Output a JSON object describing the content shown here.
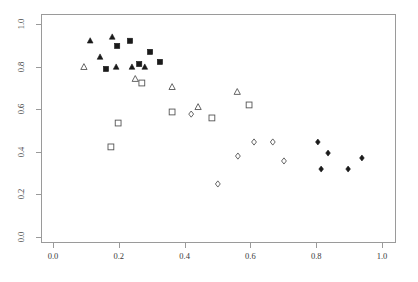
{
  "chart_data": {
    "type": "scatter",
    "title": "",
    "xlabel": "",
    "ylabel": "",
    "xlim": [
      0.0,
      1.0
    ],
    "ylim": [
      0.0,
      1.0
    ],
    "grid": false,
    "legend": "none",
    "xticks": [
      "0.0",
      "0.2",
      "0.4",
      "0.6",
      "0.8",
      "1.0"
    ],
    "xtick_values": [
      0.0,
      0.2,
      0.4,
      0.6,
      0.8,
      1.0
    ],
    "yticks": [
      "0.0",
      "0.2",
      "0.4",
      "0.6",
      "0.8",
      "1.0"
    ],
    "ytick_values": [
      0.0,
      0.2,
      0.4,
      0.6,
      0.8,
      1.0
    ],
    "frame": true,
    "series": [
      {
        "name": "filled-triangle",
        "marker": "triangle-filled",
        "color": "#1a1a1a",
        "points": [
          {
            "x": 0.113,
            "y": 0.921
          },
          {
            "x": 0.18,
            "y": 0.939
          },
          {
            "x": 0.143,
            "y": 0.845
          },
          {
            "x": 0.192,
            "y": 0.798
          },
          {
            "x": 0.24,
            "y": 0.798
          },
          {
            "x": 0.279,
            "y": 0.798
          }
        ]
      },
      {
        "name": "filled-square",
        "marker": "square-filled",
        "color": "#1a1a1a",
        "points": [
          {
            "x": 0.195,
            "y": 0.897
          },
          {
            "x": 0.234,
            "y": 0.921
          },
          {
            "x": 0.295,
            "y": 0.869
          },
          {
            "x": 0.262,
            "y": 0.812
          },
          {
            "x": 0.161,
            "y": 0.789
          },
          {
            "x": 0.325,
            "y": 0.822
          }
        ]
      },
      {
        "name": "open-triangle",
        "marker": "triangle-open",
        "color": "#555555",
        "points": [
          {
            "x": 0.094,
            "y": 0.798
          },
          {
            "x": 0.25,
            "y": 0.742
          },
          {
            "x": 0.362,
            "y": 0.704
          },
          {
            "x": 0.441,
            "y": 0.61
          },
          {
            "x": 0.56,
            "y": 0.681
          }
        ]
      },
      {
        "name": "open-square",
        "marker": "square-open",
        "color": "#555555",
        "points": [
          {
            "x": 0.198,
            "y": 0.535
          },
          {
            "x": 0.176,
            "y": 0.423
          },
          {
            "x": 0.362,
            "y": 0.587
          },
          {
            "x": 0.483,
            "y": 0.559
          },
          {
            "x": 0.596,
            "y": 0.62
          },
          {
            "x": 0.27,
            "y": 0.723
          }
        ]
      },
      {
        "name": "open-diamond",
        "marker": "diamond-open",
        "color": "#555555",
        "points": [
          {
            "x": 0.42,
            "y": 0.577
          },
          {
            "x": 0.501,
            "y": 0.249
          },
          {
            "x": 0.611,
            "y": 0.446
          },
          {
            "x": 0.668,
            "y": 0.446
          },
          {
            "x": 0.702,
            "y": 0.357
          },
          {
            "x": 0.562,
            "y": 0.38
          }
        ]
      },
      {
        "name": "filled-diamond",
        "marker": "diamond-filled",
        "color": "#1a1a1a",
        "points": [
          {
            "x": 0.805,
            "y": 0.446
          },
          {
            "x": 0.836,
            "y": 0.394
          },
          {
            "x": 0.939,
            "y": 0.371
          },
          {
            "x": 0.815,
            "y": 0.319
          },
          {
            "x": 0.897,
            "y": 0.319
          }
        ]
      }
    ]
  },
  "axes": {
    "frame_color": "#9a9a9a",
    "tick_color": "#9a9a9a",
    "label_color": "#3a3a3a"
  }
}
